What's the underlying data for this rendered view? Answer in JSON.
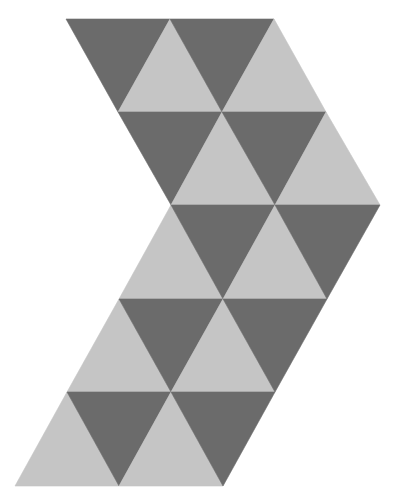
{
  "figure": {
    "width": 402,
    "height": 502,
    "background": "#ffffff",
    "shape": "chevron-of-equilateral-triangles",
    "colors": {
      "dark": "#6b6b6b",
      "light": "#c5c5c5"
    },
    "rows": [
      {
        "triangles": [
          {
            "tone": "dark",
            "points": [
              [
                66,
                19
              ],
              [
                170,
                19
              ],
              [
                118,
                112
              ]
            ]
          },
          {
            "tone": "light",
            "points": [
              [
                118,
                112
              ],
              [
                170,
                19
              ],
              [
                222,
                112
              ]
            ]
          },
          {
            "tone": "dark",
            "points": [
              [
                170,
                19
              ],
              [
                274,
                19
              ],
              [
                222,
                112
              ]
            ]
          },
          {
            "tone": "light",
            "points": [
              [
                222,
                112
              ],
              [
                274,
                19
              ],
              [
                326,
                112
              ]
            ]
          }
        ]
      },
      {
        "triangles": [
          {
            "tone": "dark",
            "points": [
              [
                118,
                112
              ],
              [
                222,
                112
              ],
              [
                171,
                205
              ]
            ]
          },
          {
            "tone": "light",
            "points": [
              [
                171,
                205
              ],
              [
                222,
                112
              ],
              [
                275,
                205
              ]
            ]
          },
          {
            "tone": "dark",
            "points": [
              [
                222,
                112
              ],
              [
                326,
                112
              ],
              [
                275,
                205
              ]
            ]
          },
          {
            "tone": "light",
            "points": [
              [
                275,
                205
              ],
              [
                326,
                112
              ],
              [
                380,
                205
              ]
            ]
          }
        ]
      },
      {
        "triangles": [
          {
            "tone": "light",
            "points": [
              [
                119,
                299
              ],
              [
                171,
                205
              ],
              [
                223,
                299
              ]
            ]
          },
          {
            "tone": "dark",
            "points": [
              [
                171,
                205
              ],
              [
                275,
                205
              ],
              [
                223,
                299
              ]
            ]
          },
          {
            "tone": "light",
            "points": [
              [
                223,
                299
              ],
              [
                275,
                205
              ],
              [
                327,
                299
              ]
            ]
          },
          {
            "tone": "dark",
            "points": [
              [
                275,
                205
              ],
              [
                380,
                205
              ],
              [
                327,
                299
              ]
            ]
          }
        ]
      },
      {
        "triangles": [
          {
            "tone": "light",
            "points": [
              [
                67,
                392
              ],
              [
                119,
                299
              ],
              [
                171,
                392
              ]
            ]
          },
          {
            "tone": "dark",
            "points": [
              [
                119,
                299
              ],
              [
                223,
                299
              ],
              [
                171,
                392
              ]
            ]
          },
          {
            "tone": "light",
            "points": [
              [
                171,
                392
              ],
              [
                223,
                299
              ],
              [
                275,
                392
              ]
            ]
          },
          {
            "tone": "dark",
            "points": [
              [
                223,
                299
              ],
              [
                327,
                299
              ],
              [
                275,
                392
              ]
            ]
          }
        ]
      },
      {
        "triangles": [
          {
            "tone": "light",
            "points": [
              [
                15,
                486
              ],
              [
                67,
                392
              ],
              [
                119,
                486
              ]
            ]
          },
          {
            "tone": "dark",
            "points": [
              [
                67,
                392
              ],
              [
                171,
                392
              ],
              [
                119,
                486
              ]
            ]
          },
          {
            "tone": "light",
            "points": [
              [
                119,
                486
              ],
              [
                171,
                392
              ],
              [
                223,
                486
              ]
            ]
          },
          {
            "tone": "dark",
            "points": [
              [
                171,
                392
              ],
              [
                275,
                392
              ],
              [
                223,
                486
              ]
            ]
          }
        ]
      }
    ]
  }
}
